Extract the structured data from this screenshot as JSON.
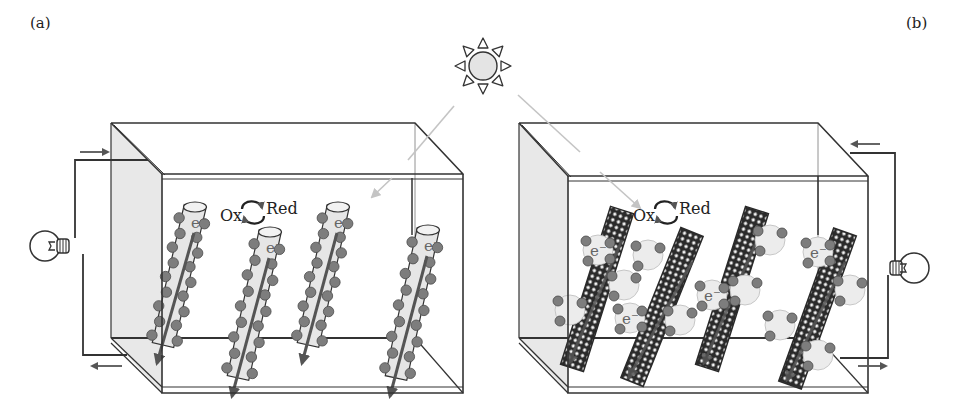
{
  "figure": {
    "panels": [
      {
        "id": "a",
        "label": "(a)",
        "label_pos": [
          30,
          14
        ],
        "electrode_type": "rod",
        "box": {
          "back_tl": [
            111,
            123
          ],
          "back_tr": [
            415,
            123
          ],
          "front_tl": [
            162,
            174
          ],
          "front_tr": [
            463,
            174
          ],
          "back_bl": [
            111,
            338
          ],
          "back_br": [
            415,
            338
          ],
          "front_bl": [
            162,
            393
          ],
          "front_br": [
            463,
            393
          ],
          "shaded_face": "left"
        },
        "redox": {
          "ox_label": "Ox",
          "red_label": "Red",
          "pos": [
            248,
            207
          ]
        },
        "electron_label": "e⁻",
        "rods": [
          {
            "top": [
              195,
              207
            ],
            "bottom": [
              163,
              345
            ]
          },
          {
            "top": [
              270,
              232
            ],
            "bottom": [
              238,
              378
            ]
          },
          {
            "top": [
              338,
              207
            ],
            "bottom": [
              308,
              345
            ]
          },
          {
            "top": [
              428,
              230
            ],
            "bottom": [
              396,
              378
            ]
          }
        ],
        "bulb": {
          "center": [
            47,
            246
          ],
          "side": "left"
        },
        "circuit": {
          "wire": [
            [
              148,
              160
            ],
            [
              75,
              160
            ],
            [
              75,
              238
            ]
          ],
          "wire2": [
            [
              83,
              254
            ],
            [
              83,
              355
            ],
            [
              127,
              355
            ]
          ],
          "inner_wire": [
            [
              412,
              178
            ],
            [
              412,
              235
            ]
          ],
          "arrows": [
            {
              "from": [
                80,
                152
              ],
              "to": [
                108,
                152
              ]
            },
            {
              "from": [
                122,
                366
              ],
              "to": [
                92,
                366
              ]
            }
          ]
        }
      },
      {
        "id": "b",
        "label": "(b)",
        "label_pos": [
          906,
          14
        ],
        "electrode_type": "nanotube",
        "box": {
          "back_tl": [
            519,
            123
          ],
          "back_tr": [
            818,
            123
          ],
          "front_tl": [
            568,
            176
          ],
          "front_tr": [
            868,
            176
          ],
          "back_bl": [
            519,
            338
          ],
          "back_br": [
            818,
            338
          ],
          "front_bl": [
            568,
            393
          ],
          "front_br": [
            868,
            393
          ],
          "shaded_face": "left"
        },
        "redox": {
          "ox_label": "Ox",
          "red_label": "Red",
          "pos": [
            661,
            207
          ]
        },
        "electron_label": "e⁻",
        "rods": [
          {
            "top": [
              622,
              210
            ],
            "bottom": [
              572,
              368
            ],
            "qd": [
              [
                598,
                250,
                "e⁻"
              ],
              [
                570,
                310,
                ""
              ],
              [
                624,
                285,
                ""
              ]
            ]
          },
          {
            "top": [
              692,
              232
            ],
            "bottom": [
              632,
              382
            ],
            "qd": [
              [
                648,
                255,
                ""
              ],
              [
                630,
                318,
                "e⁻"
              ],
              [
                680,
                320,
                ""
              ]
            ]
          },
          {
            "top": [
              757,
              210
            ],
            "bottom": [
              707,
              368
            ],
            "qd": [
              [
                770,
                240,
                ""
              ],
              [
                712,
                295,
                "e⁻"
              ],
              [
                745,
                290,
                ""
              ]
            ]
          },
          {
            "top": [
              845,
              232
            ],
            "bottom": [
              790,
              385
            ],
            "qd": [
              [
                818,
                252,
                "e⁻"
              ],
              [
                850,
                290,
                ""
              ],
              [
                780,
                325,
                ""
              ],
              [
                818,
                355,
                ""
              ]
            ]
          }
        ],
        "bulb": {
          "center": [
            912,
            268
          ],
          "side": "right"
        },
        "circuit": {
          "wire": [
            [
              850,
              153
            ],
            [
              895,
              153
            ],
            [
              895,
              262
            ]
          ],
          "wire2": [
            [
              888,
              275
            ],
            [
              888,
              358
            ],
            [
              840,
              358
            ]
          ],
          "inner_wire": [
            [
              818,
              176
            ],
            [
              818,
              235
            ]
          ],
          "arrows": [
            {
              "from": [
                880,
                144
              ],
              "to": [
                852,
                144
              ]
            },
            {
              "from": [
                858,
                366
              ],
              "to": [
                886,
                366
              ]
            }
          ]
        }
      }
    ],
    "light_source": {
      "name": "sun",
      "center": [
        483,
        66
      ],
      "radius": 14,
      "rays": [
        {
          "segments": [
            [
              [
                454,
                106
              ],
              [
                408,
                160
              ]
            ],
            [
              [
                392,
                178
              ],
              [
                372,
                197
              ]
            ]
          ]
        },
        {
          "segments": [
            [
              [
                518,
                95
              ],
              [
                580,
                152
              ]
            ],
            [
              [
                600,
                172
              ],
              [
                640,
                208
              ]
            ]
          ]
        }
      ]
    },
    "colors": {
      "line": "#333333",
      "wall_shade": "#e8e8e8",
      "rod_fill": "#e6e6e6",
      "dot_fill": "#7d7d7d",
      "dot_stroke": "#4a4a4a",
      "arrow": "#555555",
      "light_ray": "#c4c4c4",
      "sun_fill": "#e4e4e4",
      "nanotube": "#2a2a2a",
      "qd_fill": "#ececec"
    }
  }
}
